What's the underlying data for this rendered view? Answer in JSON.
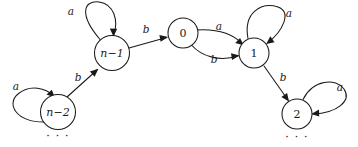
{
  "figure": {
    "kind": "state-transition-diagram",
    "background_color": "#ffffff",
    "stroke_color": "#1a1a1a",
    "width": 358,
    "height": 147
  },
  "nodes": [
    {
      "id": "n_minus_1",
      "label": "n−1",
      "cx": 112,
      "cy": 53,
      "r": 17.5,
      "numeric": false
    },
    {
      "id": "zero",
      "label": "0",
      "cx": 183,
      "cy": 33,
      "r": 15.0,
      "numeric": true
    },
    {
      "id": "one",
      "label": "1",
      "cx": 254,
      "cy": 53,
      "r": 15.0,
      "numeric": true
    },
    {
      "id": "n_minus_2",
      "label": "n−2",
      "cx": 58,
      "cy": 112,
      "r": 17.5,
      "numeric": false
    },
    {
      "id": "two",
      "label": "2",
      "cx": 297,
      "cy": 114,
      "r": 15.0,
      "numeric": true
    }
  ],
  "edges": [
    {
      "id": "e-nminus1-self",
      "from": "n_minus_1",
      "to": "n_minus_1",
      "label": "a",
      "label_x": 71,
      "label_y": 12,
      "kind": "self-loop"
    },
    {
      "id": "e-nminus1-zero",
      "from": "n_minus_1",
      "to": "zero",
      "label": "b",
      "label_x": 146,
      "label_y": 30,
      "kind": "straight"
    },
    {
      "id": "e-zero-one-a",
      "from": "zero",
      "to": "one",
      "label": "a",
      "label_x": 219,
      "label_y": 27,
      "kind": "curve-upper"
    },
    {
      "id": "e-zero-one-b",
      "from": "zero",
      "to": "one",
      "label": "b",
      "label_x": 214,
      "label_y": 60,
      "kind": "curve-lower"
    },
    {
      "id": "e-one-self",
      "from": "one",
      "to": "one",
      "label": "a",
      "label_x": 289,
      "label_y": 14,
      "kind": "self-loop"
    },
    {
      "id": "e-nminus2-self",
      "from": "n_minus_2",
      "to": "n_minus_2",
      "label": "a",
      "label_x": 16,
      "label_y": 87,
      "kind": "self-loop"
    },
    {
      "id": "e-nminus2-nminus1",
      "from": "n_minus_2",
      "to": "n_minus_1",
      "label": "b",
      "label_x": 78,
      "label_y": 78,
      "kind": "straight"
    },
    {
      "id": "e-one-two",
      "from": "one",
      "to": "two",
      "label": "b",
      "label_x": 283,
      "label_y": 78,
      "kind": "straight"
    },
    {
      "id": "e-two-self",
      "from": "two",
      "to": "two",
      "label": "a",
      "label_x": 340,
      "label_y": 88,
      "kind": "self-loop"
    }
  ],
  "ellipses": [
    {
      "id": "ellipsis-left",
      "label": "· · ·",
      "x": 58,
      "y": 137
    },
    {
      "id": "ellipsis-right",
      "label": "· · ·",
      "x": 297,
      "y": 138
    }
  ],
  "alphabet": [
    "a",
    "b"
  ]
}
